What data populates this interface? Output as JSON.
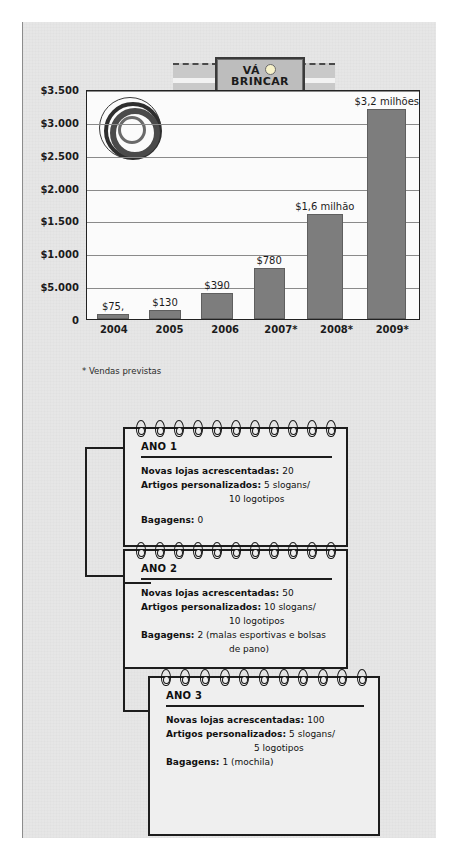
{
  "logo": {
    "line1_a": "VÁ",
    "line1_b": "BRINCAR",
    "line2": "AO AR LIVRE",
    "sun_icon": "sun-icon"
  },
  "chart_data": {
    "type": "bar",
    "title": "",
    "categories": [
      "2004",
      "2005",
      "2006",
      "2007*",
      "2008*",
      "2009*"
    ],
    "values": [
      75,
      130,
      390,
      780,
      1600,
      3200
    ],
    "bar_labels": [
      "$75,",
      "$130",
      "$390",
      "$780",
      "$1,6 milhão",
      "$3,2 milhões"
    ],
    "ytick_labels": [
      "$3.500",
      "$3.000",
      "$2.500",
      "$2.000",
      "$1.500",
      "$1.000",
      "$5.000",
      "0"
    ],
    "ytick_values": [
      3500,
      3000,
      2500,
      2000,
      1500,
      1000,
      500,
      0
    ],
    "ylim": [
      0,
      3500
    ],
    "xlabel": "",
    "ylabel": "",
    "grid": true,
    "legend": "none",
    "footnote": "* Vendas previstas",
    "bar_color": "#7d7d7d",
    "plot_bg": "#fbfbfb"
  },
  "cards": [
    {
      "title": "ANO 1",
      "rows": [
        {
          "label": "Novas lojas acrescentadas:",
          "value": "20"
        },
        {
          "label": "Artigos personalizados:",
          "value": "5 slogans/"
        },
        {
          "label": "",
          "value": "10 logotipos",
          "indent": true
        },
        {
          "label": "Bagagens:",
          "value": "0",
          "gap": true
        }
      ]
    },
    {
      "title": "ANO 2",
      "rows": [
        {
          "label": "Novas lojas acrescentadas:",
          "value": "50"
        },
        {
          "label": "Artigos personalizados:",
          "value": "10 slogans/"
        },
        {
          "label": "",
          "value": "10 logotipos",
          "indent": true
        },
        {
          "label": "Bagagens:",
          "value": "2 (malas esportivas e bolsas"
        },
        {
          "label": "",
          "value": "de pano)",
          "indent": true
        }
      ]
    },
    {
      "title": "ANO 3",
      "rows": [
        {
          "label": "Novas lojas acrescentadas:",
          "value": "100"
        },
        {
          "label": "Artigos personalizados:",
          "value": "5 slogans/"
        },
        {
          "label": "",
          "value": "5 logotipos",
          "indent": true
        },
        {
          "label": "Bagagens:",
          "value": "1 (mochila)"
        }
      ]
    }
  ]
}
